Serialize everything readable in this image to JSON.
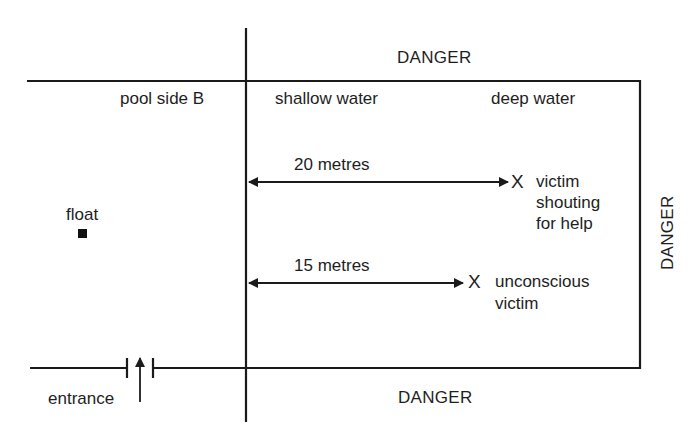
{
  "diagram": {
    "type": "pool-rescue-layout",
    "labels": {
      "danger_top": "DANGER",
      "danger_right": "DANGER",
      "danger_bottom": "DANGER",
      "pool_side": "pool side B",
      "shallow": "shallow water",
      "deep": "deep water",
      "float": "float",
      "entrance": "entrance"
    },
    "distances": [
      {
        "label": "20 metres",
        "marker": "X",
        "victim": [
          "victim",
          "shouting",
          "for help"
        ]
      },
      {
        "label": "15 metres",
        "marker": "X",
        "victim": [
          "unconscious",
          "victim"
        ]
      }
    ],
    "colors": {
      "line": "#1a1a1a",
      "background": "#ffffff"
    }
  }
}
